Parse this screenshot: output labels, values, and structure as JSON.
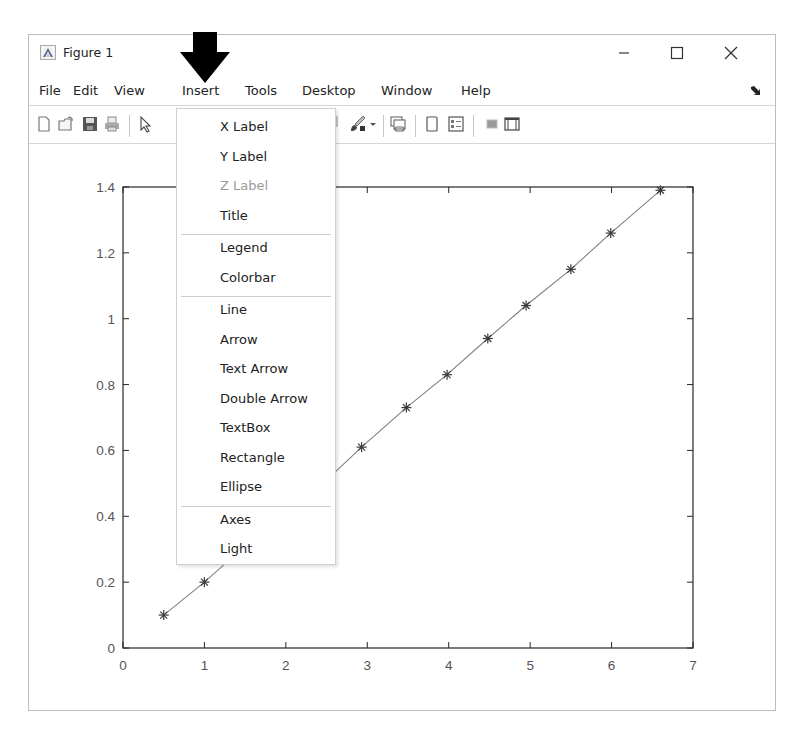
{
  "window": {
    "title": "Figure 1",
    "controls": {
      "minimize": "—",
      "maximize": "☐",
      "close": "✕"
    }
  },
  "menubar": {
    "items": [
      {
        "label": "File"
      },
      {
        "label": "Edit"
      },
      {
        "label": "View"
      },
      {
        "label": "Insert",
        "active": true
      },
      {
        "label": "Tools"
      },
      {
        "label": "Desktop"
      },
      {
        "label": "Window"
      },
      {
        "label": "Help"
      }
    ],
    "dock_icon": "dock-arrow-icon"
  },
  "toolbar": {
    "icons": [
      "new-figure-icon",
      "open-file-icon",
      "save-icon",
      "print-icon",
      "pointer-icon",
      "data-cursor-icon",
      "brush-icon",
      "brush-dropdown-icon",
      "link-plot-icon",
      "hide-plot-tools-icon",
      "show-plot-tools-icon",
      "colorbar-icon",
      "legend-box-icon"
    ]
  },
  "insert_menu": {
    "groups": [
      [
        {
          "label": "X Label",
          "enabled": true
        },
        {
          "label": "Y Label",
          "enabled": true
        },
        {
          "label": "Z Label",
          "enabled": false
        },
        {
          "label": "Title",
          "enabled": true
        }
      ],
      [
        {
          "label": "Legend",
          "enabled": true
        },
        {
          "label": "Colorbar",
          "enabled": true
        }
      ],
      [
        {
          "label": "Line",
          "enabled": true
        },
        {
          "label": "Arrow",
          "enabled": true
        },
        {
          "label": "Text Arrow",
          "enabled": true
        },
        {
          "label": "Double Arrow",
          "enabled": true
        },
        {
          "label": "TextBox",
          "enabled": true
        },
        {
          "label": "Rectangle",
          "enabled": true
        },
        {
          "label": "Ellipse",
          "enabled": true
        }
      ],
      [
        {
          "label": "Axes",
          "enabled": true
        },
        {
          "label": "Light",
          "enabled": true
        }
      ]
    ]
  },
  "annotation": {
    "type": "arrow-down",
    "points_to": "Insert",
    "color": "#000000"
  },
  "chart_data": {
    "type": "line",
    "title": "",
    "xlabel": "",
    "ylabel": "",
    "marker": "*",
    "line_color": "#808080",
    "x": [
      0.5,
      1.0,
      1.5,
      2.0,
      2.5,
      2.93,
      3.48,
      3.98,
      4.48,
      4.95,
      5.5,
      5.99,
      6.6
    ],
    "y": [
      0.1,
      0.2,
      0.31,
      0.41,
      0.51,
      0.61,
      0.73,
      0.83,
      0.94,
      1.04,
      1.15,
      1.26,
      1.39
    ],
    "xlim": [
      0,
      7
    ],
    "ylim": [
      0,
      1.4
    ],
    "xticks": [
      "0",
      "1",
      "2",
      "3",
      "4",
      "5",
      "6",
      "7"
    ],
    "yticks": [
      "0",
      "0.2",
      "0.4",
      "0.6",
      "0.8",
      "1",
      "1.2",
      "1.4"
    ],
    "grid": false,
    "legend": null,
    "note": "Points at x≈1.5, 2.0, 2.5 are hidden behind the Insert menu; values are interpolated"
  }
}
